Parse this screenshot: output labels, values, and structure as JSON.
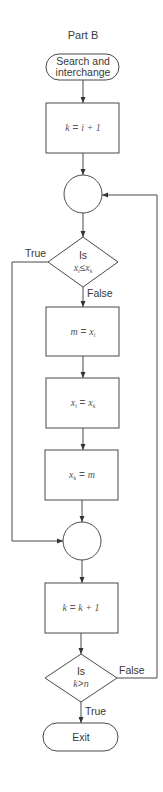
{
  "diagram": {
    "title": "Part B",
    "start": {
      "label_line1": "Search and",
      "label_line2": "interchange"
    },
    "step_init": {
      "var": "k",
      "op": " = ",
      "expr": "i + 1"
    },
    "junction_top": {},
    "decision_compare": {
      "line1": "Is",
      "left": "x",
      "left_sub": "i",
      "op": "≤",
      "right": "x",
      "right_sub": "k",
      "true_label": "True",
      "false_label": "False"
    },
    "step_swap1": {
      "left": "m",
      "op": " = ",
      "right": "x",
      "right_sub": "i"
    },
    "step_swap2": {
      "left": "x",
      "left_sub": "i",
      "op": " = ",
      "right": "x",
      "right_sub": "k"
    },
    "step_swap3": {
      "left": "x",
      "left_sub": "k",
      "op": " = ",
      "right": "m"
    },
    "junction_bottom": {},
    "step_increment": {
      "var": "k",
      "op": " = ",
      "expr": "k + 1"
    },
    "decision_end": {
      "line1": "Is",
      "cond_left": "k",
      "cond_op": ">",
      "cond_right": "n",
      "true_label": "True",
      "false_label": "False"
    },
    "end": {
      "label": "Exit"
    },
    "colors": {
      "stroke": "#4a4a4a",
      "text": "#3a3a3a",
      "background": "#ffffff"
    }
  }
}
